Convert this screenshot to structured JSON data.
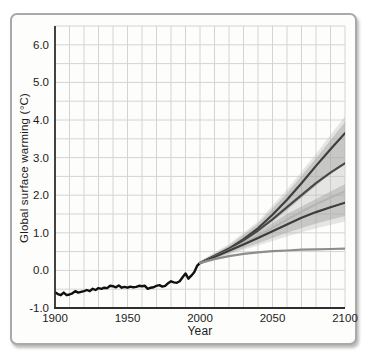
{
  "figure": {
    "frame_border_color": "#a9a9a9",
    "frame_background": "#fdfdfb"
  },
  "chart_data": {
    "type": "line",
    "title": "",
    "xlabel": "Year",
    "ylabel": "Global surface warming (°C)",
    "xlim": [
      1900,
      2100
    ],
    "ylim": [
      -1.0,
      6.5
    ],
    "x_ticks": [
      1900,
      1950,
      2000,
      2050,
      2100
    ],
    "y_ticks": [
      -1.0,
      0.0,
      1.0,
      2.0,
      3.0,
      4.0,
      5.0,
      6.0
    ],
    "grid": {
      "on": true,
      "x_step_years": 10,
      "y_step": 0.5,
      "color": "#d4d4d4"
    },
    "axis_color": "#2e2e2e",
    "label_color": "#1c1c1c",
    "legend": "none",
    "bands": [
      {
        "name": "full-scenario-range",
        "color": "#bdbdbd",
        "opacity": 0.38,
        "x": [
          2000,
          2020,
          2040,
          2060,
          2080,
          2100
        ],
        "top": [
          0.25,
          0.7,
          1.3,
          2.15,
          3.1,
          4.1
        ],
        "bottom": [
          0.15,
          0.42,
          0.66,
          0.9,
          1.12,
          1.3
        ]
      },
      {
        "name": "upper-scenario-range",
        "color": "#9a9a9a",
        "opacity": 0.4,
        "x": [
          2000,
          2020,
          2040,
          2060,
          2080,
          2100
        ],
        "top": [
          0.24,
          0.66,
          1.24,
          2.05,
          2.98,
          3.95
        ],
        "bottom": [
          0.19,
          0.55,
          1.0,
          1.6,
          2.25,
          2.9
        ]
      },
      {
        "name": "lower-scenario-range",
        "color": "#9a9a9a",
        "opacity": 0.4,
        "x": [
          2000,
          2020,
          2040,
          2060,
          2080,
          2100
        ],
        "top": [
          0.22,
          0.58,
          1.02,
          1.5,
          1.9,
          2.3
        ],
        "bottom": [
          0.16,
          0.45,
          0.72,
          1.0,
          1.25,
          1.45
        ]
      }
    ],
    "series": [
      {
        "name": "observed-20th-century",
        "color": "#101010",
        "width": 2.4,
        "x": [
          1900,
          1902,
          1904,
          1906,
          1908,
          1910,
          1912,
          1914,
          1916,
          1918,
          1920,
          1922,
          1924,
          1926,
          1928,
          1930,
          1932,
          1934,
          1936,
          1938,
          1940,
          1942,
          1944,
          1946,
          1948,
          1950,
          1952,
          1954,
          1956,
          1958,
          1960,
          1962,
          1964,
          1966,
          1968,
          1970,
          1972,
          1974,
          1976,
          1978,
          1980,
          1982,
          1984,
          1986,
          1988,
          1990,
          1992,
          1994,
          1996,
          1998,
          2000
        ],
        "y": [
          -0.58,
          -0.63,
          -0.66,
          -0.59,
          -0.66,
          -0.64,
          -0.61,
          -0.55,
          -0.59,
          -0.57,
          -0.55,
          -0.52,
          -0.55,
          -0.49,
          -0.52,
          -0.47,
          -0.49,
          -0.46,
          -0.47,
          -0.41,
          -0.42,
          -0.45,
          -0.4,
          -0.46,
          -0.44,
          -0.46,
          -0.43,
          -0.45,
          -0.44,
          -0.41,
          -0.42,
          -0.41,
          -0.49,
          -0.46,
          -0.45,
          -0.41,
          -0.39,
          -0.43,
          -0.41,
          -0.34,
          -0.29,
          -0.32,
          -0.33,
          -0.29,
          -0.18,
          -0.08,
          -0.22,
          -0.14,
          -0.05,
          0.12,
          0.2
        ]
      },
      {
        "name": "scenario-high",
        "color": "#3f3f3f",
        "width": 2.2,
        "x": [
          2000,
          2010,
          2020,
          2030,
          2040,
          2050,
          2060,
          2070,
          2080,
          2090,
          2100
        ],
        "y": [
          0.2,
          0.38,
          0.58,
          0.83,
          1.12,
          1.48,
          1.88,
          2.32,
          2.78,
          3.22,
          3.65
        ]
      },
      {
        "name": "scenario-mid",
        "color": "#484848",
        "width": 2.2,
        "x": [
          2000,
          2010,
          2020,
          2030,
          2040,
          2050,
          2060,
          2070,
          2080,
          2090,
          2100
        ],
        "y": [
          0.2,
          0.38,
          0.57,
          0.8,
          1.06,
          1.36,
          1.68,
          2.0,
          2.32,
          2.6,
          2.85
        ]
      },
      {
        "name": "scenario-mid-light",
        "color": "#b5b5b5",
        "width": 2.2,
        "x": [
          2000,
          2010,
          2020,
          2030,
          2040,
          2050,
          2060,
          2070,
          2080,
          2090,
          2100
        ],
        "y": [
          0.2,
          0.36,
          0.53,
          0.72,
          0.92,
          1.13,
          1.35,
          1.56,
          1.76,
          1.94,
          2.1
        ]
      },
      {
        "name": "scenario-low",
        "color": "#3c3c3c",
        "width": 2.2,
        "x": [
          2000,
          2010,
          2020,
          2030,
          2040,
          2050,
          2060,
          2070,
          2080,
          2090,
          2100
        ],
        "y": [
          0.2,
          0.36,
          0.52,
          0.69,
          0.86,
          1.04,
          1.22,
          1.4,
          1.55,
          1.68,
          1.8
        ]
      },
      {
        "name": "constant-composition-commitment",
        "color": "#8d8d8d",
        "width": 2.2,
        "x": [
          2000,
          2010,
          2020,
          2030,
          2040,
          2050,
          2060,
          2070,
          2080,
          2090,
          2100
        ],
        "y": [
          0.2,
          0.3,
          0.38,
          0.44,
          0.48,
          0.51,
          0.53,
          0.55,
          0.56,
          0.57,
          0.58
        ]
      }
    ]
  }
}
